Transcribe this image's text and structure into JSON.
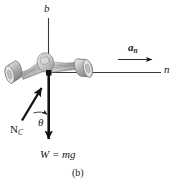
{
  "figure": {
    "caption": "(b)",
    "background_color": "#ffffff",
    "line_color": "#1a1a1a",
    "vehicle_fill": "#c9c9c9",
    "vehicle_stroke": "#6e6e6e"
  },
  "axes": [
    {
      "id": "b-axis",
      "label": "b",
      "orientation": "vertical",
      "label_position": "top"
    },
    {
      "id": "n-axis",
      "label": "n",
      "orientation": "horizontal",
      "label_position": "right"
    }
  ],
  "vectors": [
    {
      "id": "acceleration",
      "symbol": "a",
      "subscript": "n",
      "bold": true,
      "direction": "right",
      "description": "normal acceleration vector"
    },
    {
      "id": "normal-force",
      "symbol": "N",
      "subscript": "C",
      "bold": false,
      "direction": "up-right-tilted",
      "description": "contact normal force on car"
    },
    {
      "id": "weight",
      "label": "W = mg",
      "direction": "down",
      "description": "weight force acting downward"
    }
  ],
  "angle": {
    "id": "theta",
    "symbol": "θ",
    "description": "angle between weight line and normal force"
  }
}
